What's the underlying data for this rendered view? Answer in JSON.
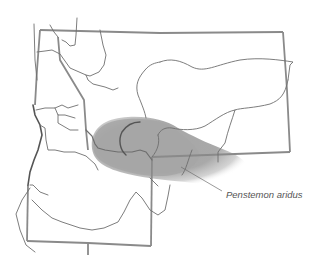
{
  "map": {
    "species_label": "Penstemon aridus",
    "colors": {
      "background": "#ffffff",
      "border": "#8a8a8a",
      "river": "#6e6e6e",
      "range_fill": "#a8a8a8",
      "label": "#555555"
    }
  }
}
